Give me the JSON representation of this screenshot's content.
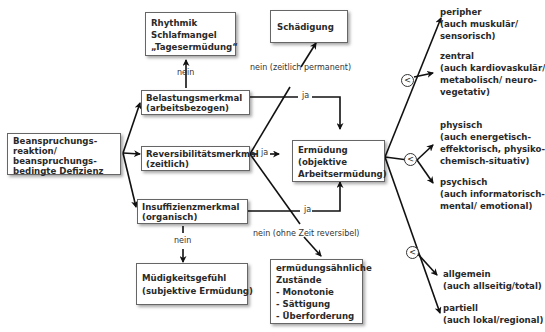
{
  "boxes": {
    "root": [
      "Beanspruchungs-",
      "reaktion/",
      "beanspruchungs-",
      "bedingte Defizienz"
    ],
    "belastung": [
      "Belastungsmerkmal",
      "(arbeitsbezogen)"
    ],
    "reversibilitaet": [
      "Reversibilitätsmerkmal",
      "(zeitlich)"
    ],
    "insuffizienz": [
      "Insuffizienzmerkmal",
      "(organisch)"
    ],
    "rhythmik": [
      "Rhythmik",
      "Schlafmangel",
      "„Tagesermüdung“"
    ],
    "schaedigung": [
      "Schädigung"
    ],
    "ermuedung": [
      "Ermüdung",
      "(objektive",
      "Arbeitsermüdung)"
    ],
    "muedigkeit": [
      "Müdigkeitsgefühl",
      "(subjektive Ermüdung)"
    ],
    "aehnlich": [
      "ermüdungsähnliche",
      "Zustände",
      "- Monotonie",
      "- Sättigung",
      "- Überforderung"
    ]
  },
  "edge_labels": {
    "nein_top": "nein",
    "nein_permanent": "nein (zeitlich permanent)",
    "ja_belastung": "ja",
    "ja_reversibel": "ja",
    "ja_insuffizienz": "ja",
    "nein_bottom": "nein",
    "nein_reversibel": "nein (ohne Zeit reversibel)"
  },
  "comparator_symbol": "<",
  "right_labels": {
    "peripher": [
      "peripher",
      "(auch muskulär/",
      "sensorisch)"
    ],
    "zentral": [
      "zentral",
      "(auch kardiovaskulär/",
      "metabolisch/ neuro-",
      "vegetativ)"
    ],
    "physisch": [
      "physisch",
      "(auch energetisch-",
      "effektorisch, physiko-",
      "chemisch-situativ)"
    ],
    "psychisch": [
      "psychisch",
      "(auch informatorisch-",
      "mental/ emotional)"
    ],
    "allgemein": [
      "allgemein",
      "(auch allseitig/total)"
    ],
    "partiell": [
      "partiell",
      "(auch lokal/regional)"
    ]
  }
}
